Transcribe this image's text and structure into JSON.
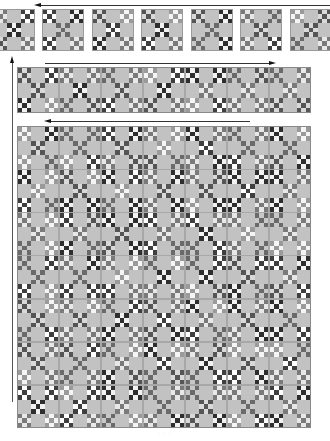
{
  "diagram": {
    "caption": "·  ·  ·",
    "colors": {
      "background": "#ffffff",
      "block_base": "#bdbdbd",
      "plain_square": "#c2c2c2",
      "border": "#9a9a9a",
      "arrow": "#222222"
    },
    "patch_palettes": [
      {
        "dark": "#2e2e2e",
        "light": "#f2f2f2"
      },
      {
        "dark": "#555555",
        "light": "#d9d9d9"
      },
      {
        "dark": "#7a7a7a",
        "light": "#e8e8e8"
      },
      {
        "dark": "#3f3f3f",
        "light": "#ffffff"
      },
      {
        "dark": "#9a9a9a",
        "light": "#f5f5f5"
      },
      {
        "dark": "#6a6a6a",
        "light": "#c8c8c8"
      }
    ],
    "stages": [
      {
        "name": "individual-blocks",
        "label": "Blocks",
        "arrow_direction": "left",
        "arrow": {
          "x": 40,
          "y": 5,
          "width": 290
        },
        "block_size": 42,
        "block_y": 9,
        "block_x_positions": [
          -7,
          42,
          92,
          141,
          191,
          240,
          290
        ]
      },
      {
        "name": "row-strip",
        "label": "Row",
        "arrow_direction": "right",
        "arrow": {
          "x": 45,
          "y": 63,
          "width": 225
        },
        "x": 17,
        "y": 67,
        "width": 294,
        "height": 46,
        "cols": 7,
        "rows": 1
      },
      {
        "name": "assembled-quilt",
        "label": "Quilt",
        "arrow_direction": "left",
        "arrow": {
          "x": 50,
          "y": 121,
          "width": 200
        },
        "x": 17,
        "y": 126,
        "width": 294,
        "height": 302,
        "cols": 7,
        "rows": 7
      }
    ],
    "vertical_arrow": {
      "direction": "up",
      "x": 12,
      "y": 62,
      "height": 340
    }
  }
}
